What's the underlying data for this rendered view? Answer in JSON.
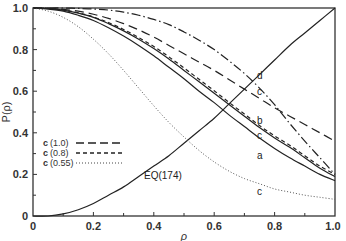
{
  "chart_data": {
    "type": "line",
    "title": "",
    "xlabel": "ρ",
    "ylabel": "P(ρ)",
    "xlim": [
      0,
      1.0
    ],
    "ylim": [
      0,
      1.0
    ],
    "grid": false,
    "x_ticks": [
      "0",
      "0.2",
      "0.4",
      "0.6",
      "0.8",
      "1.0"
    ],
    "y_ticks": [
      "0",
      "0.2",
      "0.4",
      "0.6",
      "0.8",
      "1.0"
    ],
    "legend_position": "lower-left inside",
    "legend": [
      {
        "label": "c",
        "param": "(1.0)",
        "style": "long-dash"
      },
      {
        "label": "c",
        "param": "(0.8)",
        "style": "short-dash"
      },
      {
        "label": "c",
        "param": "(0.55)",
        "style": "dotted"
      }
    ],
    "x": [
      0,
      0.05,
      0.1,
      0.15,
      0.2,
      0.25,
      0.3,
      0.35,
      0.4,
      0.45,
      0.5,
      0.55,
      0.6,
      0.65,
      0.7,
      0.75,
      0.8,
      0.85,
      0.9,
      0.95,
      1.0
    ],
    "series": [
      {
        "name": "EQ(174)",
        "style": "solid",
        "annotation": "EQ(174)",
        "values": [
          0.0,
          0.0,
          0.01,
          0.03,
          0.06,
          0.1,
          0.14,
          0.19,
          0.24,
          0.29,
          0.35,
          0.41,
          0.47,
          0.54,
          0.61,
          0.68,
          0.75,
          0.82,
          0.88,
          0.94,
          1.0
        ]
      },
      {
        "name": "a",
        "style": "solid",
        "annotation": "a",
        "values": [
          1.0,
          0.995,
          0.985,
          0.965,
          0.94,
          0.905,
          0.865,
          0.82,
          0.77,
          0.715,
          0.66,
          0.6,
          0.545,
          0.485,
          0.43,
          0.375,
          0.325,
          0.28,
          0.24,
          0.2,
          0.17
        ]
      },
      {
        "name": "b",
        "style": "solid",
        "annotation": "b",
        "values": [
          1.0,
          0.998,
          0.99,
          0.975,
          0.955,
          0.925,
          0.89,
          0.85,
          0.805,
          0.755,
          0.7,
          0.645,
          0.59,
          0.535,
          0.48,
          0.425,
          0.375,
          0.33,
          0.28,
          0.23,
          0.19
        ]
      },
      {
        "name": "c (1.0)",
        "style": "long-dash",
        "annotation": "c",
        "values": [
          1.0,
          0.998,
          0.993,
          0.985,
          0.97,
          0.95,
          0.925,
          0.895,
          0.86,
          0.82,
          0.78,
          0.74,
          0.7,
          0.655,
          0.61,
          0.565,
          0.52,
          0.48,
          0.44,
          0.4,
          0.36
        ]
      },
      {
        "name": "c (0.8)",
        "style": "short-dash",
        "annotation": "c",
        "values": [
          1.0,
          0.998,
          0.99,
          0.977,
          0.957,
          0.93,
          0.897,
          0.858,
          0.815,
          0.765,
          0.712,
          0.657,
          0.602,
          0.545,
          0.49,
          0.435,
          0.385,
          0.34,
          0.29,
          0.24,
          0.2
        ]
      },
      {
        "name": "c (0.55)",
        "style": "dotted",
        "annotation": "c",
        "values": [
          1.0,
          0.985,
          0.955,
          0.91,
          0.85,
          0.78,
          0.7,
          0.615,
          0.53,
          0.45,
          0.38,
          0.315,
          0.26,
          0.215,
          0.18,
          0.155,
          0.13,
          0.115,
          0.1,
          0.09,
          0.08
        ]
      },
      {
        "name": "d",
        "style": "dash-dot",
        "annotation": "d",
        "values": [
          1.0,
          1.0,
          1.0,
          0.998,
          0.995,
          0.99,
          0.98,
          0.965,
          0.945,
          0.92,
          0.885,
          0.845,
          0.8,
          0.745,
          0.685,
          0.615,
          0.535,
          0.445,
          0.36,
          0.28,
          0.2
        ]
      }
    ]
  },
  "annotations": {
    "eq_label": "EQ(174)",
    "label_a": "a",
    "label_b": "b",
    "label_c_upper": "c",
    "label_c_mid": "c",
    "label_c_low": "c",
    "label_d": "d"
  },
  "legend_labels": {
    "c1_letter": "c",
    "c1_param": "(1.0)",
    "c2_letter": "c",
    "c2_param": "(0.8)",
    "c3_letter": "c",
    "c3_param": "(0.55)"
  },
  "axes": {
    "xlabel": "ρ",
    "ylabel": "P(ρ)",
    "x0": "0",
    "x1": "0.2",
    "x2": "0.4",
    "x3": "0.6",
    "x4": "0.8",
    "x5": "1.0",
    "y0": "0",
    "y1": "0.2",
    "y2": "0.4",
    "y3": "0.6",
    "y4": "0.8",
    "y5": "1.0"
  }
}
